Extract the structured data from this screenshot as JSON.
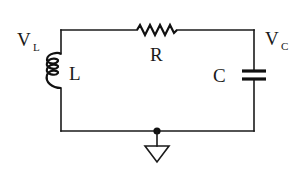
{
  "diagram": {
    "type": "circuit-schematic",
    "components": [
      {
        "id": "R",
        "kind": "resistor",
        "label": "R",
        "position": "top"
      },
      {
        "id": "L",
        "kind": "inductor",
        "label": "L",
        "position": "left"
      },
      {
        "id": "C",
        "kind": "capacitor",
        "label": "C",
        "position": "right"
      }
    ],
    "nodes": [
      {
        "id": "VL",
        "label_main": "V",
        "label_sub": "L",
        "position": "top-left corner"
      },
      {
        "id": "VC",
        "label_main": "V",
        "label_sub": "C",
        "position": "top-right corner"
      },
      {
        "id": "GND",
        "kind": "ground",
        "position": "bottom-center"
      }
    ],
    "colors": {
      "ink": "#1a1a1a",
      "background": "#ffffff"
    }
  }
}
